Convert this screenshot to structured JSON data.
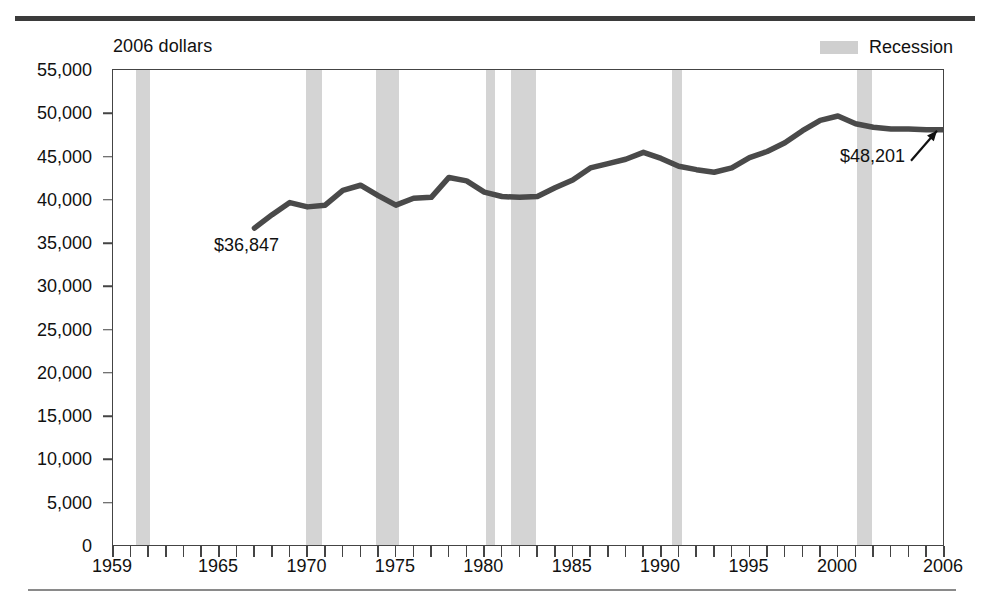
{
  "figure": {
    "units_caption": "2006 dollars",
    "legend": {
      "label": "Recession",
      "swatch_color": "#d4d4d4"
    },
    "annotations": {
      "start_value_label": "$36,847",
      "end_value_label": "$48,201"
    },
    "line_color": "#4a4a4a",
    "frame_color": "#444444"
  },
  "chart_data": {
    "type": "line",
    "title": "",
    "subtitle": "",
    "xlabel": "",
    "ylabel": "2006 dollars",
    "xlim": [
      1959,
      2006
    ],
    "ylim": [
      0,
      55000
    ],
    "grid": false,
    "legend_position": "top-right",
    "y_ticks": [
      0,
      5000,
      10000,
      15000,
      20000,
      25000,
      30000,
      35000,
      40000,
      45000,
      50000,
      55000
    ],
    "y_tick_labels": [
      "0",
      "5,000",
      "10,000",
      "15,000",
      "20,000",
      "25,000",
      "30,000",
      "35,000",
      "40,000",
      "45,000",
      "50,000",
      "55,000"
    ],
    "x_ticks_minor_step": 1,
    "x_tick_labels": [
      "1959",
      "1965",
      "1970",
      "1975",
      "1980",
      "1985",
      "1990",
      "1995",
      "2000",
      "2006"
    ],
    "x_tick_label_values": [
      1959,
      1965,
      1970,
      1975,
      1980,
      1985,
      1990,
      1995,
      2000,
      2006
    ],
    "series": [
      {
        "name": "Median household income",
        "color": "#4a4a4a",
        "x": [
          1967,
          1968,
          1969,
          1970,
          1971,
          1972,
          1973,
          1974,
          1975,
          1976,
          1977,
          1978,
          1979,
          1980,
          1981,
          1982,
          1983,
          1984,
          1985,
          1986,
          1987,
          1988,
          1989,
          1990,
          1991,
          1992,
          1993,
          1994,
          1995,
          1996,
          1997,
          1998,
          1999,
          2000,
          2001,
          2002,
          2003,
          2004,
          2005,
          2006
        ],
        "values": [
          36847,
          38400,
          39800,
          39300,
          39500,
          41200,
          41800,
          40600,
          39500,
          40300,
          40400,
          42700,
          42300,
          41000,
          40500,
          40400,
          40500,
          41500,
          42400,
          43800,
          44300,
          44800,
          45600,
          44900,
          44000,
          43600,
          43300,
          43800,
          45000,
          45700,
          46700,
          48100,
          49300,
          49800,
          48900,
          48500,
          48300,
          48300,
          48200,
          48201
        ],
        "annotated_points": [
          {
            "x": 1967,
            "y": 36847,
            "label": "$36,847"
          },
          {
            "x": 2006,
            "y": 48201,
            "label": "$48,201"
          }
        ]
      }
    ],
    "shaded_regions": {
      "label": "Recession",
      "color": "#d4d4d4",
      "spans": [
        {
          "start": 1960.3,
          "end": 1961.1
        },
        {
          "start": 1969.9,
          "end": 1970.8
        },
        {
          "start": 1973.9,
          "end": 1975.2
        },
        {
          "start": 1980.1,
          "end": 1980.6
        },
        {
          "start": 1981.5,
          "end": 1982.9
        },
        {
          "start": 1990.6,
          "end": 1991.2
        },
        {
          "start": 2001.1,
          "end": 2001.9
        }
      ]
    }
  }
}
